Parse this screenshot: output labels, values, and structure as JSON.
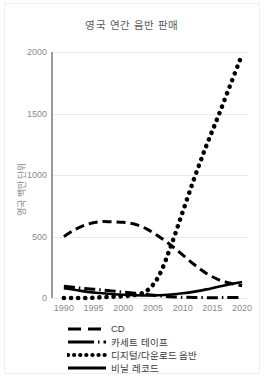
{
  "chart_data": {
    "type": "line",
    "title": "영국 연간 음반 판매",
    "xlabel": "",
    "ylabel": "영국 백만 단위",
    "xlim": [
      1988,
      2021
    ],
    "ylim": [
      0,
      2000
    ],
    "xticks": [
      "1990",
      "1995",
      "2000",
      "2005",
      "2010",
      "2015",
      "2020"
    ],
    "yticks": [
      "0",
      "500",
      "1000",
      "1500",
      "2000"
    ],
    "grid": true,
    "legend_position": "bottom",
    "x": [
      1990,
      1992,
      1994,
      1996,
      1998,
      2000,
      2002,
      2004,
      2006,
      2008,
      2010,
      2012,
      2014,
      2016,
      2018,
      2020
    ],
    "series": [
      {
        "name": "CD",
        "style": "dashed",
        "color": "#000000",
        "values": [
          500,
          560,
          600,
          620,
          620,
          615,
          600,
          560,
          500,
          430,
          350,
          270,
          200,
          150,
          120,
          100
        ]
      },
      {
        "name": "카세트 테이프",
        "style": "dash-dot",
        "color": "#000000",
        "values": [
          95,
          85,
          75,
          68,
          58,
          48,
          38,
          28,
          18,
          10,
          6,
          4,
          3,
          3,
          4,
          5
        ]
      },
      {
        "name": "디지털/다운로드 음반",
        "style": "dotted",
        "color": "#000000",
        "values": [
          0,
          0,
          0,
          5,
          10,
          15,
          25,
          60,
          180,
          420,
          700,
          980,
          1240,
          1480,
          1730,
          1980
        ]
      },
      {
        "name": "비닐 레코드",
        "style": "solid",
        "color": "#000000",
        "values": [
          80,
          65,
          50,
          40,
          32,
          26,
          22,
          20,
          22,
          28,
          38,
          52,
          70,
          92,
          112,
          130
        ]
      }
    ]
  },
  "legend": {
    "items": [
      {
        "label": "CD",
        "key": "dashed"
      },
      {
        "label": "카세트 테이프",
        "key": "dash-dot"
      },
      {
        "label": "디지털/다운로드 음반",
        "key": "dotted"
      },
      {
        "label": "비닐 레코드",
        "key": "solid"
      }
    ]
  }
}
